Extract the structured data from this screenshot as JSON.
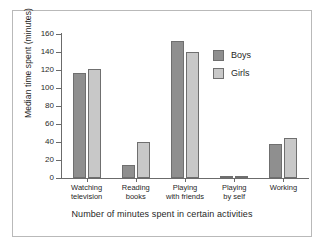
{
  "chart_data": {
    "type": "bar",
    "title": "",
    "xlabel": "Number of minutes spent in certain activities",
    "ylabel": "Median time spent (minutes)",
    "ylim": [
      0,
      160
    ],
    "yticks": [
      0,
      20,
      40,
      60,
      80,
      100,
      120,
      140,
      160
    ],
    "ytick_labels": [
      "0",
      "20",
      "40",
      "60",
      "80",
      "100",
      "120",
      "140",
      "160"
    ],
    "grid": false,
    "legend_position": "upper right",
    "categories": [
      "Watching television",
      "Reading books",
      "Playing with friends",
      "Playing by self",
      "Working"
    ],
    "category_lines": [
      [
        "Watching",
        "television"
      ],
      [
        "Reading",
        "books"
      ],
      [
        "Playing",
        "with friends"
      ],
      [
        "Playing",
        "by self"
      ],
      [
        "Working",
        ""
      ]
    ],
    "series": [
      {
        "name": "Boys",
        "color": "#8f8f8f",
        "values": [
          117,
          15,
          152,
          1,
          38
        ]
      },
      {
        "name": "Girls",
        "color": "#c8c8c8",
        "values": [
          121,
          40,
          140,
          1,
          45
        ]
      }
    ]
  },
  "legend": {
    "items": [
      {
        "label": "Boys",
        "color": "#8f8f8f"
      },
      {
        "label": "Girls",
        "color": "#c8c8c8"
      }
    ]
  },
  "colors": {
    "boys": "#8f8f8f",
    "girls": "#c8c8c8",
    "axis": "#6b6b6b",
    "border": "#b9b9b9",
    "text": "#1f1f1f",
    "background": "#ffffff"
  }
}
